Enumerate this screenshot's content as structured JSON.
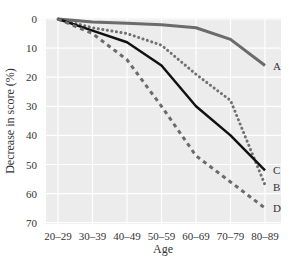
{
  "chart_data": {
    "type": "line",
    "title": "",
    "xlabel": "Age",
    "ylabel": "Decrease in score (%)",
    "categories": [
      "20–29",
      "30–39",
      "40–49",
      "50–59",
      "60–69",
      "70–79",
      "80–89"
    ],
    "ylim": [
      0,
      70
    ],
    "y_inverted": true,
    "yticks": [
      0,
      10,
      20,
      30,
      40,
      50,
      60,
      70
    ],
    "grid": true,
    "series": [
      {
        "name": "A",
        "style": "solid-gray",
        "values": [
          0,
          1,
          1.5,
          2,
          3,
          7,
          16
        ]
      },
      {
        "name": "B",
        "style": "dotted",
        "values": [
          0,
          3,
          5,
          9,
          19,
          28,
          57
        ]
      },
      {
        "name": "C",
        "style": "solid-black",
        "values": [
          0,
          4,
          8,
          16,
          30,
          40,
          52
        ]
      },
      {
        "name": "D",
        "style": "dashed",
        "values": [
          0,
          5,
          14,
          30,
          47,
          56,
          65
        ]
      }
    ]
  }
}
